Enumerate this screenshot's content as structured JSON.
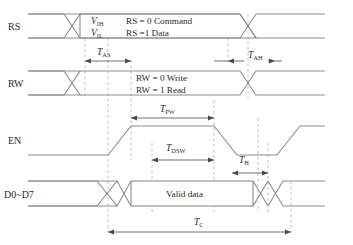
{
  "figure": {
    "kind": "timing-diagram",
    "title_fragment": "",
    "stroke_color": "#8d8d8d",
    "guide_color": "#b2b2b2",
    "dim_color": "#4a4a4a",
    "text_color": "#2b2b2b",
    "background": "#ffffff"
  },
  "signals": [
    {
      "id": "rs",
      "label": "RS"
    },
    {
      "id": "rw",
      "label": "RW"
    },
    {
      "id": "en",
      "label": "EN"
    },
    {
      "id": "data",
      "label": "D0~D7"
    }
  ],
  "annotations": {
    "rs_vih": "V",
    "rs_vih_sub": "IH",
    "rs_vil": "V",
    "rs_vil_sub": "IL",
    "rs_line1": "RS = 0 Command",
    "rs_line2": "RS =1 Data",
    "rw_line1": "RW = 0 Write",
    "rw_line2": "RW = 1 Read",
    "data_valid": "Valid data"
  },
  "timings": [
    {
      "id": "t_as",
      "symbol": "T",
      "sub": "AS",
      "row": "rs-rw-gap",
      "arrows": "inside",
      "from": 85,
      "to": 130
    },
    {
      "id": "t_ah",
      "symbol": "T",
      "sub": "AH",
      "row": "rs-rw-gap",
      "arrows": "outside",
      "from": 228,
      "to": 275
    },
    {
      "id": "t_pw",
      "symbol": "T",
      "sub": "PW",
      "row": "rw-en-gap",
      "arrows": "inside",
      "from": 131,
      "to": 214
    },
    {
      "id": "t_dsw",
      "symbol": "T",
      "sub": "DSW",
      "row": "en-data-gap",
      "arrows": "inside",
      "from": 152,
      "to": 214
    },
    {
      "id": "t_h",
      "symbol": "T",
      "sub": "H",
      "row": "en-data-gap",
      "arrows": "inside",
      "from": 232,
      "to": 268
    },
    {
      "id": "t_c",
      "symbol": "T",
      "sub": "C",
      "row": "below-data",
      "arrows": "inside",
      "from": 108,
      "to": 291
    }
  ],
  "guides_x": [
    85,
    108,
    131,
    152,
    214,
    228,
    248,
    258,
    268,
    291
  ],
  "geometry": {
    "width": 353,
    "height": 245,
    "rows": {
      "rs": {
        "top": 14,
        "bottom": 38
      },
      "rw": {
        "top": 71,
        "bottom": 95
      },
      "en": {
        "top": 125,
        "bottom": 155
      },
      "data": {
        "top": 181,
        "bottom": 206
      }
    }
  }
}
